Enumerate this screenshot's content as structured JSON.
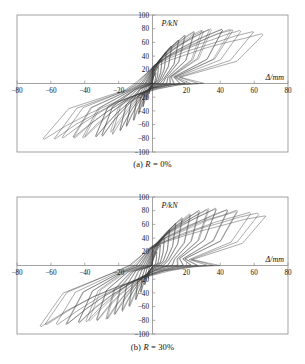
{
  "figure": {
    "panels": [
      {
        "id": "panel-a",
        "caption_prefix": "(a) ",
        "caption_var": "R",
        "caption_value": " = 0%",
        "caption_full": "(a) R = 0%"
      },
      {
        "id": "panel-b",
        "caption_prefix": "(b) ",
        "caption_var": "R",
        "caption_value": " = 30%",
        "caption_full": "(b) R = 30%"
      }
    ]
  },
  "chart_data": [
    {
      "type": "line",
      "id": "hysteresis-a",
      "title": "",
      "subtitle": "(a) R = 0%",
      "xlabel": "Δ/mm",
      "ylabel": "P/kN",
      "xlim": [
        -80,
        80
      ],
      "ylim": [
        -100,
        100
      ],
      "xticks": [
        -80,
        -60,
        -40,
        -20,
        0,
        20,
        40,
        60,
        80
      ],
      "xticklabels": [
        "-80",
        "-60",
        "-40",
        "-20",
        "",
        "20",
        "40",
        "60",
        "80"
      ],
      "yticks": [
        -100,
        -80,
        -60,
        -40,
        -20,
        0,
        20,
        40,
        60,
        80,
        100
      ],
      "yticklabels": [
        "-100",
        "-80",
        "-60",
        "-40",
        "-20",
        "",
        "20",
        "40",
        "60",
        "80",
        "100"
      ],
      "grid": false,
      "legend": "none",
      "line_color": "#2b2b2b",
      "axis_color": "#8a8a8a",
      "frame": true,
      "description": "Pinched hysteretic load-displacement loops, symmetric, increasing amplitude cycles",
      "cycles": [
        {
          "dx": 2.0,
          "py": 16,
          "pn": -15,
          "repeats": 2,
          "pinch": 0.62,
          "res": 0.2
        },
        {
          "dx": 3.5,
          "py": 25,
          "pn": -24,
          "repeats": 2,
          "pinch": 0.6,
          "res": 0.22
        },
        {
          "dx": 5.5,
          "py": 35,
          "pn": -34,
          "repeats": 2,
          "pinch": 0.56,
          "res": 0.24
        },
        {
          "dx": 8.0,
          "py": 45,
          "pn": -44,
          "repeats": 2,
          "pinch": 0.52,
          "res": 0.26
        },
        {
          "dx": 11.0,
          "py": 55,
          "pn": -54,
          "repeats": 2,
          "pinch": 0.48,
          "res": 0.28
        },
        {
          "dx": 15.0,
          "py": 63,
          "pn": -62,
          "repeats": 2,
          "pinch": 0.44,
          "res": 0.3
        },
        {
          "dx": 19.0,
          "py": 70,
          "pn": -68,
          "repeats": 2,
          "pinch": 0.4,
          "res": 0.32
        },
        {
          "dx": 24.0,
          "py": 75,
          "pn": -73,
          "repeats": 2,
          "pinch": 0.37,
          "res": 0.34
        },
        {
          "dx": 29.0,
          "py": 78,
          "pn": -76,
          "repeats": 2,
          "pinch": 0.34,
          "res": 0.36
        },
        {
          "dx": 34.0,
          "py": 80,
          "pn": -78,
          "repeats": 2,
          "pinch": 0.32,
          "res": 0.38
        },
        {
          "dx": 40.0,
          "py": 80,
          "pn": -79,
          "repeats": 2,
          "pinch": 0.3,
          "res": 0.4
        },
        {
          "dx": 46.0,
          "py": 79,
          "pn": -80,
          "repeats": 2,
          "pinch": 0.28,
          "res": 0.42
        },
        {
          "dx": 52.0,
          "py": 77,
          "pn": -80,
          "repeats": 1,
          "pinch": 0.27,
          "res": 0.44
        },
        {
          "dx": 58.0,
          "py": 75,
          "pn": -81,
          "repeats": 1,
          "pinch": 0.26,
          "res": 0.46
        },
        {
          "dx": 63.0,
          "py": 73,
          "pn": -82,
          "repeats": 1,
          "pinch": 0.25,
          "res": 0.47
        }
      ],
      "peak_positive_load": 80,
      "peak_negative_load": -82,
      "max_positive_disp": 63,
      "max_negative_disp": -63
    },
    {
      "type": "line",
      "id": "hysteresis-b",
      "title": "",
      "subtitle": "(b) R = 30%",
      "xlabel": "Δ/mm",
      "ylabel": "P/kN",
      "xlim": [
        -80,
        80
      ],
      "ylim": [
        -100,
        100
      ],
      "xticks": [
        -80,
        -60,
        -40,
        -20,
        0,
        20,
        40,
        60,
        80
      ],
      "xticklabels": [
        "-80",
        "-60",
        "-40",
        "-20",
        "",
        "20",
        "40",
        "60",
        "80"
      ],
      "yticks": [
        -100,
        -80,
        -60,
        -40,
        -20,
        0,
        20,
        40,
        60,
        80,
        100
      ],
      "yticklabels": [
        "-100",
        "-80",
        "-60",
        "-40",
        "-20",
        "",
        "20",
        "40",
        "60",
        "80",
        "100"
      ],
      "grid": false,
      "legend": "none",
      "line_color": "#2b2b2b",
      "axis_color": "#8a8a8a",
      "frame": true,
      "description": "Fuller, wider hysteretic loops with larger energy dissipation than panel (a)",
      "cycles": [
        {
          "dx": 2.5,
          "py": 20,
          "pn": -18,
          "repeats": 2,
          "pinch": 0.7,
          "res": 0.24
        },
        {
          "dx": 4.5,
          "py": 30,
          "pn": -28,
          "repeats": 2,
          "pinch": 0.68,
          "res": 0.26
        },
        {
          "dx": 7.0,
          "py": 41,
          "pn": -39,
          "repeats": 2,
          "pinch": 0.65,
          "res": 0.28
        },
        {
          "dx": 10.0,
          "py": 52,
          "pn": -50,
          "repeats": 2,
          "pinch": 0.62,
          "res": 0.31
        },
        {
          "dx": 13.5,
          "py": 61,
          "pn": -59,
          "repeats": 2,
          "pinch": 0.58,
          "res": 0.34
        },
        {
          "dx": 17.5,
          "py": 69,
          "pn": -66,
          "repeats": 2,
          "pinch": 0.54,
          "res": 0.37
        },
        {
          "dx": 22.0,
          "py": 75,
          "pn": -72,
          "repeats": 2,
          "pinch": 0.5,
          "res": 0.4
        },
        {
          "dx": 27.0,
          "py": 79,
          "pn": -77,
          "repeats": 2,
          "pinch": 0.47,
          "res": 0.43
        },
        {
          "dx": 32.5,
          "py": 82,
          "pn": -80,
          "repeats": 2,
          "pinch": 0.44,
          "res": 0.46
        },
        {
          "dx": 38.0,
          "py": 83,
          "pn": -82,
          "repeats": 2,
          "pinch": 0.42,
          "res": 0.49
        },
        {
          "dx": 44.0,
          "py": 82,
          "pn": -84,
          "repeats": 2,
          "pinch": 0.4,
          "res": 0.52
        },
        {
          "dx": 50.0,
          "py": 80,
          "pn": -85,
          "repeats": 2,
          "pinch": 0.38,
          "res": 0.54
        },
        {
          "dx": 56.0,
          "py": 78,
          "pn": -86,
          "repeats": 1,
          "pinch": 0.37,
          "res": 0.56
        },
        {
          "dx": 62.0,
          "py": 75,
          "pn": -87,
          "repeats": 1,
          "pinch": 0.36,
          "res": 0.58
        },
        {
          "dx": 67.0,
          "py": 73,
          "pn": -88,
          "repeats": 1,
          "pinch": 0.35,
          "res": 0.6
        }
      ],
      "peak_positive_load": 83,
      "peak_negative_load": -88,
      "max_positive_disp": 67,
      "max_negative_disp": -72
    }
  ]
}
